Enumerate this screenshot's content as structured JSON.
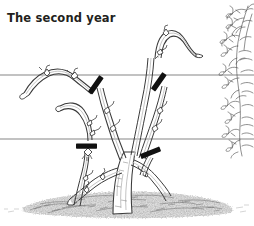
{
  "figure": {
    "title": "The second year",
    "caption_position": "top-left",
    "background_color": "#ffffff",
    "ink_color": "#2b2b2b",
    "title_color": "#231f20",
    "width": 254,
    "height": 226,
    "style": "pen-and-ink botanical line illustration"
  },
  "trellis": {
    "wire_color": "#6f6f6f",
    "wires": [
      {
        "name": "top-wire",
        "y": 75,
        "x_start": 0,
        "x_end": 254
      },
      {
        "name": "bottom-wire",
        "y": 139,
        "x_start": 0,
        "x_end": 254
      }
    ]
  },
  "pruning_marks": {
    "color": "#111111",
    "label": "pruning cut mark",
    "marks": [
      {
        "name": "pruning-mark-upper-left",
        "x": 96,
        "y": 85,
        "angle": -55,
        "length": 19
      },
      {
        "name": "pruning-mark-upper-right",
        "x": 159,
        "y": 82,
        "angle": -55,
        "length": 19
      },
      {
        "name": "pruning-mark-lower-left",
        "x": 86,
        "y": 146,
        "angle": 0,
        "length": 19
      },
      {
        "name": "pruning-mark-lower-right",
        "x": 150,
        "y": 153,
        "angle": -22,
        "length": 19
      }
    ]
  },
  "plant": {
    "trunk_label": "main trunk",
    "cane_outline_color": "#3a3a3a",
    "cane_fill_color": "#ffffff",
    "shade_color": "#9a9a9a",
    "canes": [
      {
        "name": "cane-upper-left-arch",
        "description": "arching cane tied along the top wire, curving down to the left"
      },
      {
        "name": "cane-upper-right-arch",
        "description": "arching cane rising above the top wire and curving to the right"
      },
      {
        "name": "cane-mid-left-arch",
        "description": "arching cane above the bottom wire curving left"
      },
      {
        "name": "cane-lower-left",
        "description": "lower left arm trained along the bottom wire"
      },
      {
        "name": "cane-lower-right",
        "description": "lower right arm trained along the bottom wire"
      },
      {
        "name": "cane-center-upright",
        "description": "central upright canes rising past the top wire"
      }
    ]
  },
  "ground": {
    "name": "mulch-mound",
    "label": "mulch",
    "color": "#8a8a8a",
    "y_top": 194,
    "y_bottom": 216
  },
  "foliage": {
    "name": "foliage-sprigs",
    "label": "leafy shoots",
    "color": "#4a4a4a",
    "edge": "right",
    "y_start": 8,
    "y_end": 158
  }
}
